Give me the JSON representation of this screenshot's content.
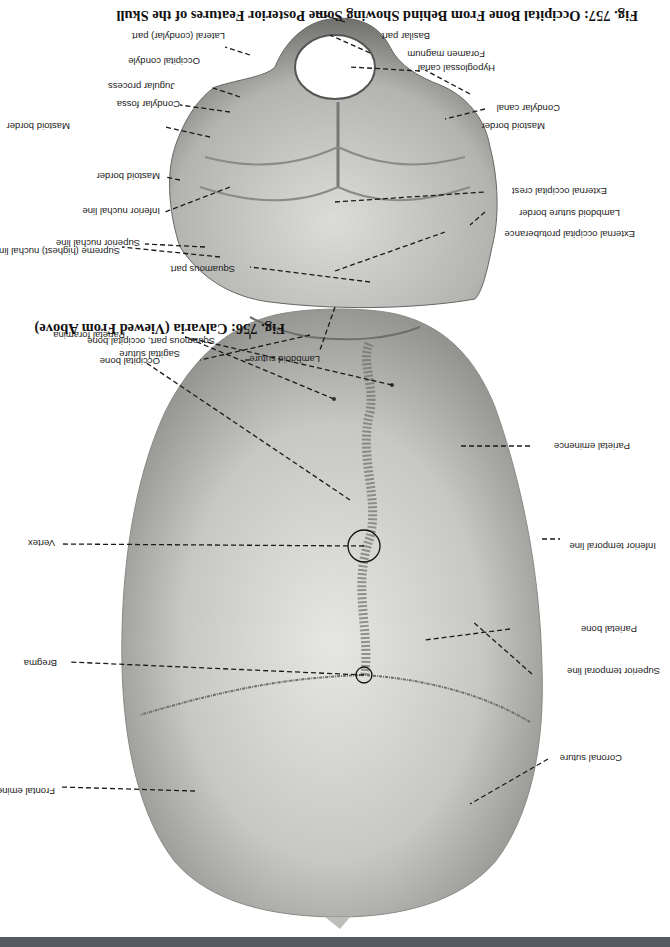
{
  "figures": [
    {
      "id": "fig756",
      "caption": "Fig. 756: Calvaria (Viewed From Above)",
      "labels": {
        "coronal_suture": "Coronal suture",
        "frontal_eminence": "Frontal eminence",
        "superior_temporal_line": "Superior temporal line",
        "parietal_bone": "Parietal bone",
        "bregma": "Bregma",
        "inferior_temporal_line": "Inferior temporal line",
        "parietal_eminence": "Parietal eminence",
        "vertex": "Vertex",
        "sagittal_suture": "Sagittal suture",
        "parietal_foramina": "Parietal foramina",
        "occipital_bone": "Occipital bone",
        "squamous_part_occipital": "Squamous part, occipital bone",
        "lambdoid_suture": "Lambdoid suture"
      }
    },
    {
      "id": "fig757",
      "caption": "Fig. 757: Occipital Bone From Behind Showing Some Posterior Features of the Skull",
      "labels": {
        "squamous_part": "Squamous part",
        "external_occipital_protuberance": "External occipital protuberance",
        "lambdoid_suture_border": "Lambdoid suture border",
        "external_occipital_crest": "External occipital crest",
        "mastoid_border_left": "Mastoid border",
        "condylar_canal": "Condylar canal",
        "hypoglossal_canal": "Hypoglossal canal",
        "foramen_magnum": "Foramen magnum",
        "basilar_part": "Basilar part",
        "lateral_condylar_part": "Lateral (condylar) part",
        "occipital_condyle": "Occipital condyle",
        "jugular_process": "Jugular process",
        "condylar_fossa": "Condylar fossa",
        "mastoid_border_right": "Mastoid border",
        "inferior_nuchal_line": "Inferior nuchal line",
        "superior_nuchal_line": "Superior nuchal line",
        "supreme_nuchal_line": "Supreme (highest) nuchal line"
      }
    }
  ],
  "colors": {
    "bone_light": "#e4e4e2",
    "bone_mid": "#b9b9b6",
    "bone_dark": "#7d7d7a",
    "leader_line": "#1a1a1a",
    "bottom_bar": "#555a5e"
  },
  "orientation": "rotated-180"
}
